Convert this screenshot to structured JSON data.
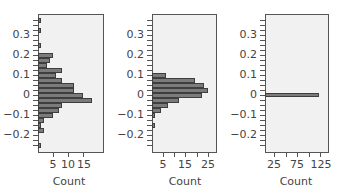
{
  "chart_data": [
    {
      "type": "bar",
      "orientation": "horizontal",
      "title": "",
      "xlabel": "Count",
      "ylabel": "",
      "ylim": [
        -0.27,
        0.39
      ],
      "xlim": [
        0,
        21
      ],
      "x_ticks": [
        5,
        10,
        15
      ],
      "y_ticks": [
        0.3,
        0.2,
        0.1,
        0,
        -0.1,
        -0.2
      ],
      "y_tick_labels": [
        "0.3",
        "0.2",
        "0.1",
        "0",
        "−0.1",
        "−0.2"
      ],
      "bins": [
        0.375,
        0.325,
        0.25,
        0.2,
        0.175,
        0.15,
        0.125,
        0.1,
        0.075,
        0.05,
        0.025,
        0,
        -0.025,
        -0.05,
        -0.075,
        -0.1,
        -0.125,
        -0.15,
        -0.175,
        -0.2,
        -0.25
      ],
      "values": [
        1,
        1,
        1,
        5,
        4,
        3,
        8,
        6,
        8,
        12,
        12,
        15,
        18,
        8,
        7,
        5,
        2,
        1,
        2,
        0,
        1
      ],
      "grid": false
    },
    {
      "type": "bar",
      "orientation": "horizontal",
      "title": "",
      "xlabel": "Count",
      "ylabel": "",
      "ylim": [
        -0.27,
        0.39
      ],
      "xlim": [
        0,
        28
      ],
      "x_ticks": [
        5,
        15,
        25
      ],
      "y_ticks": [
        0.3,
        0.2,
        0.1,
        0,
        -0.1,
        -0.2
      ],
      "y_tick_labels": [
        "0.3",
        "0.2",
        "0.1",
        "0",
        "−0.1",
        "−0.2"
      ],
      "bins": [
        0.1,
        0.075,
        0.05,
        0.025,
        0,
        -0.025,
        -0.05,
        -0.075,
        -0.1,
        -0.15
      ],
      "values": [
        6,
        19,
        23,
        25,
        22,
        12,
        7,
        4,
        1,
        1
      ],
      "grid": false
    },
    {
      "type": "bar",
      "orientation": "horizontal",
      "title": "",
      "xlabel": "Count",
      "ylabel": "",
      "ylim": [
        -0.27,
        0.39
      ],
      "xlim": [
        0,
        138
      ],
      "x_ticks": [
        25,
        75,
        125
      ],
      "y_ticks": [
        0.3,
        0.2,
        0.1,
        0,
        -0.1,
        -0.2
      ],
      "y_tick_labels": [
        "0.3",
        "0.2",
        "0.1",
        "0",
        "−0.1",
        "−0.2"
      ],
      "bins": [
        0.0
      ],
      "values": [
        125
      ],
      "grid": false
    }
  ],
  "panels": [
    {
      "xlabel": "Count",
      "x_tick_labels": [
        "5",
        "10",
        "15"
      ],
      "y_tick_labels": [
        "0.3",
        "0.2",
        "0.1",
        "0",
        "−0.1",
        "−0.2"
      ]
    },
    {
      "xlabel": "Count",
      "x_tick_labels": [
        "5",
        "15",
        "25"
      ],
      "y_tick_labels": [
        "0.3",
        "0.2",
        "0.1",
        "0",
        "−0.1",
        "−0.2"
      ]
    },
    {
      "xlabel": "Count",
      "x_tick_labels": [
        "25",
        "75",
        "125"
      ],
      "y_tick_labels": [
        "0.3",
        "0.2",
        "0.1",
        "0",
        "−0.1",
        "−0.2"
      ]
    }
  ],
  "colors": {
    "bar_fill": "#7b7b7b",
    "bar_edge": "#3e3e3e",
    "plot_bg": "#f1f1f1",
    "frame": "#555555"
  }
}
